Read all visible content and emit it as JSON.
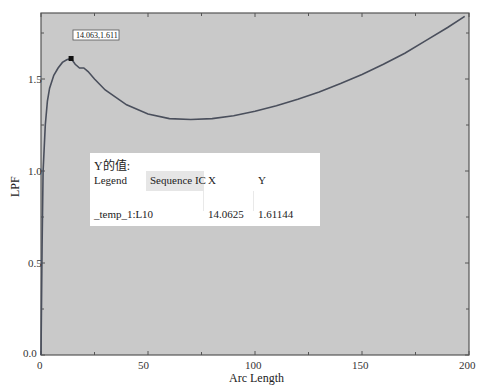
{
  "chart_data": {
    "type": "line",
    "title": "",
    "xlabel": "Arc Length",
    "ylabel": "LPF",
    "xlim": [
      0,
      200
    ],
    "ylim": [
      0.0,
      1.85
    ],
    "x_ticks": [
      "0",
      "50",
      "100",
      "150",
      "200"
    ],
    "y_ticks": [
      "0.0",
      "0.5",
      "1.0",
      "1.5"
    ],
    "grid": false,
    "legend_position": "none",
    "series": [
      {
        "name": "_temp_1:L",
        "x": [
          0,
          0.5,
          1,
          2,
          3,
          4,
          6,
          8,
          10,
          12,
          14.0625,
          16,
          18,
          20,
          22,
          25,
          30,
          35,
          40,
          50,
          60,
          70,
          80,
          90,
          100,
          110,
          120,
          130,
          140,
          150,
          160,
          170,
          180,
          190,
          198
        ],
        "y": [
          0.0,
          0.6,
          1.0,
          1.25,
          1.38,
          1.45,
          1.52,
          1.56,
          1.59,
          1.605,
          1.61144,
          1.58,
          1.56,
          1.56,
          1.54,
          1.5,
          1.44,
          1.4,
          1.36,
          1.31,
          1.285,
          1.28,
          1.285,
          1.3,
          1.325,
          1.355,
          1.39,
          1.43,
          1.475,
          1.525,
          1.58,
          1.64,
          1.71,
          1.78,
          1.84
        ]
      }
    ],
    "annotations": [
      {
        "text": "14.063,1.611",
        "x": 14.0625,
        "y": 1.61144
      }
    ]
  },
  "marker_label": "14.063,1.611",
  "info_panel": {
    "title": "Y的值:",
    "headers": {
      "legend": "Legend",
      "sequence": "Sequence IC",
      "x": "X",
      "y": "Y"
    },
    "row": {
      "legend": "_temp_1:L",
      "sequence": "10",
      "x": "14.0625",
      "y": "1.61144"
    }
  },
  "colors": {
    "plot_background": "#c9c9c9",
    "curve": "#4a4f5c",
    "axis": "#555555",
    "panel_background": "#ffffff"
  }
}
